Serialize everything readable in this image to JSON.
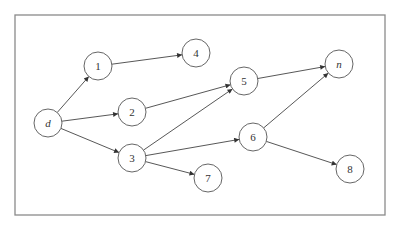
{
  "diagram": {
    "type": "directed-graph",
    "frame": {
      "x": 15,
      "y": 15,
      "width": 370,
      "height": 200
    },
    "node_radius": 14,
    "nodes": [
      {
        "id": "d",
        "label": "d",
        "italic": true,
        "x": 48,
        "y": 123
      },
      {
        "id": "1",
        "label": "1",
        "italic": false,
        "x": 98,
        "y": 66
      },
      {
        "id": "2",
        "label": "2",
        "italic": false,
        "x": 132,
        "y": 112
      },
      {
        "id": "3",
        "label": "3",
        "italic": false,
        "x": 132,
        "y": 158
      },
      {
        "id": "4",
        "label": "4",
        "italic": false,
        "x": 196,
        "y": 53
      },
      {
        "id": "5",
        "label": "5",
        "italic": false,
        "x": 244,
        "y": 81
      },
      {
        "id": "6",
        "label": "6",
        "italic": false,
        "x": 253,
        "y": 137
      },
      {
        "id": "7",
        "label": "7",
        "italic": false,
        "x": 208,
        "y": 178
      },
      {
        "id": "n",
        "label": "n",
        "italic": true,
        "x": 339,
        "y": 64
      },
      {
        "id": "8",
        "label": "8",
        "italic": false,
        "x": 350,
        "y": 169
      }
    ],
    "edges": [
      {
        "from": "d",
        "to": "1"
      },
      {
        "from": "d",
        "to": "2"
      },
      {
        "from": "d",
        "to": "3"
      },
      {
        "from": "1",
        "to": "4"
      },
      {
        "from": "2",
        "to": "5"
      },
      {
        "from": "3",
        "to": "5"
      },
      {
        "from": "3",
        "to": "6"
      },
      {
        "from": "3",
        "to": "7"
      },
      {
        "from": "5",
        "to": "n"
      },
      {
        "from": "6",
        "to": "n"
      },
      {
        "from": "6",
        "to": "8"
      }
    ],
    "colors": {
      "frame": "#8a8a8a",
      "node_stroke": "#555555",
      "edge": "#444444",
      "text": "#333333"
    }
  },
  "caption": {
    "text": "",
    "note": "faint illegible caption line"
  }
}
